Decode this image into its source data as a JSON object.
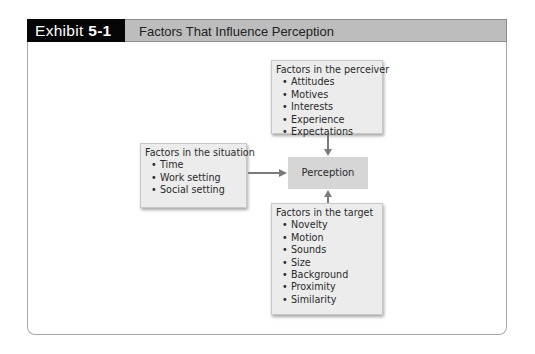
{
  "header": {
    "exhibit_prefix": "Exhibit ",
    "exhibit_number": "5-1",
    "title": "Factors That Influence Perception"
  },
  "diagram": {
    "center": {
      "label": "Perception"
    },
    "perceiver": {
      "title": "Factors in the perceiver",
      "items": [
        "Attitudes",
        "Motives",
        "Interests",
        "Experience",
        "Expectations"
      ]
    },
    "situation": {
      "title": "Factors in the situation",
      "items": [
        "Time",
        "Work setting",
        "Social setting"
      ]
    },
    "target": {
      "title": "Factors in the target",
      "items": [
        "Novelty",
        "Motion",
        "Sounds",
        "Size",
        "Background",
        "Proximity",
        "Similarity"
      ]
    },
    "colors": {
      "header_black": "#050505",
      "header_gray": "#bdbdbd",
      "box_fill": "#ececec",
      "center_fill": "#d6d6d6",
      "arrow": "#7a7a7a"
    }
  }
}
